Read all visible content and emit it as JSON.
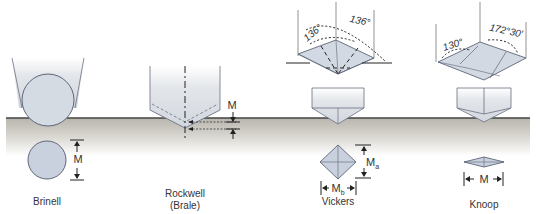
{
  "figure": {
    "colors": {
      "surface_line": "#444444",
      "material_top": "#bdbab2",
      "material_bottom": "#ffffff",
      "indenter_fill": "#d9dde3",
      "indenter_edge": "#6a7080",
      "indentation_fill": "#c9d1de",
      "text": "#333333"
    }
  },
  "tests": [
    {
      "name": "Brinell",
      "label": "Brinell",
      "indenter": "steel ball",
      "measure_label": "M"
    },
    {
      "name": "Rockwell",
      "label_line1": "Rockwell",
      "label_line2": "(Brale)",
      "indenter": "diamond cone",
      "measure_label": "M"
    },
    {
      "name": "Vickers",
      "label": "Vickers",
      "indenter": "square pyramid",
      "angle_1": "136°",
      "angle_2": "136°",
      "measure_a": "M",
      "measure_a_sub": "a",
      "measure_b": "M",
      "measure_b_sub": "b"
    },
    {
      "name": "Knoop",
      "label": "Knoop",
      "indenter": "elongated pyramid",
      "angle_1": "130°",
      "angle_2": "172°30′",
      "measure_label": "M"
    }
  ]
}
